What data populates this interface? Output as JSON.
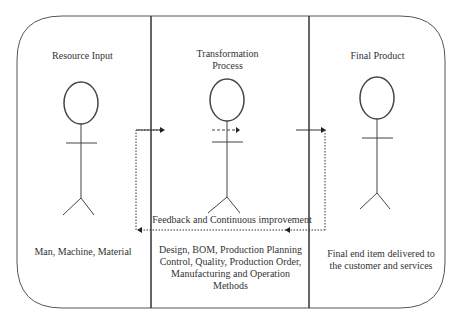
{
  "diagram": {
    "columns": [
      {
        "title": "Resource Input",
        "caption": "Man, Machine, Material"
      },
      {
        "title_line1": "Transformation",
        "title_line2": "Process",
        "caption_lines": [
          "Design, BOM, Production Planning",
          "Control, Quality, Production Order,",
          "Manufacturing and Operation",
          "Methods"
        ]
      },
      {
        "title": "Final Product",
        "caption_lines": [
          "Final end item delivered to",
          "the customer and services"
        ]
      }
    ],
    "feedback_label": "Feedback and Continuous improvement"
  }
}
